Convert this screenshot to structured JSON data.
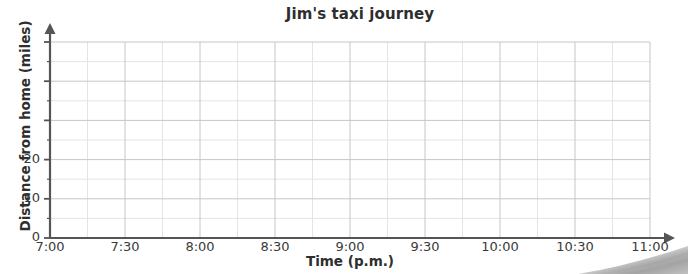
{
  "chart_data": {
    "type": "line",
    "title": "Jim's taxi journey",
    "xlabel": "Time (p.m.)",
    "ylabel": "Distance from home (miles)",
    "x_tick_labels": [
      "7:00",
      "7:30",
      "8:00",
      "8:30",
      "9:00",
      "9:30",
      "10:00",
      "10:30",
      "11:00"
    ],
    "y_tick_labels": [
      "0",
      "10",
      "20"
    ],
    "y_tick_values": [
      0,
      10,
      20
    ],
    "xlim": [
      "7:00",
      "11:00"
    ],
    "ylim": [
      0,
      50
    ],
    "y_major_step": 10,
    "y_minor_step": 5,
    "x_major_step_minutes": 30,
    "x_minor_step_minutes": 15,
    "grid": true,
    "legend": "none",
    "series": [],
    "values": [],
    "note": "Empty grid provided for plotting; no data line is drawn."
  },
  "axes": {
    "y_axis_arrow": true,
    "x_axis_arrow": true,
    "axis_color": "#555555",
    "major_grid_color": "#c6c6c6",
    "minor_grid_color": "#e4e4e4"
  },
  "page": {
    "corner_artifact": "scanned-page-curl-shadow"
  }
}
